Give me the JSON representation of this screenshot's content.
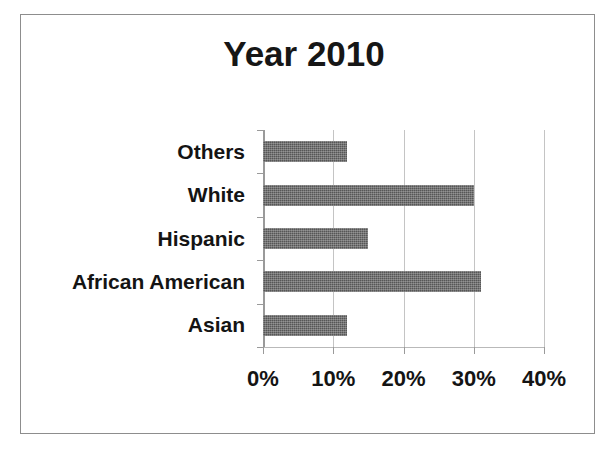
{
  "figure": {
    "frame_border_color": "#8d8d8d",
    "background": "#ffffff"
  },
  "chart_data": {
    "type": "bar",
    "orientation": "horizontal",
    "title": "Year 2010",
    "xlabel": "",
    "ylabel": "",
    "categories": [
      "Asian",
      "African American",
      "Hispanic",
      "White",
      "Others"
    ],
    "values": [
      12,
      31,
      15,
      30,
      12
    ],
    "value_unit": "%",
    "xlim": [
      0,
      40
    ],
    "xticks": [
      0,
      10,
      20,
      30,
      40
    ],
    "xtick_labels": [
      "0%",
      "10%",
      "20%",
      "30%",
      "40%"
    ],
    "grid": true,
    "grid_axis": "x",
    "legend": false,
    "bar_color": "#565656",
    "gridline_color": "#c4c4c4",
    "axis_color": "#9a9a9a",
    "text_color": "#141414",
    "category_order_top_to_bottom": [
      "Others",
      "White",
      "Hispanic",
      "African American",
      "Asian"
    ],
    "series": [
      {
        "name": "Year 2010",
        "points": [
          {
            "category": "Others",
            "value": 12
          },
          {
            "category": "White",
            "value": 30
          },
          {
            "category": "Hispanic",
            "value": 15
          },
          {
            "category": "African American",
            "value": 31
          },
          {
            "category": "Asian",
            "value": 12
          }
        ]
      }
    ]
  }
}
